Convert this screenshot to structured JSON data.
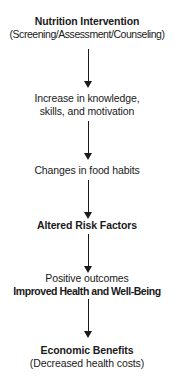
{
  "diagram": {
    "background_color": "#ffffff",
    "text_color": "#1a1a1a",
    "arrow_color": "#1a1a1a",
    "orientation": "top-to-bottom",
    "node_count": 6,
    "arrow_count": 5
  },
  "nodes": [
    {
      "id": "nutrition-intervention",
      "line1": "Nutrition Intervention",
      "line2": "(Screening/Assessment/Counseling)"
    },
    {
      "id": "increase-knowledge",
      "line1": "Increase in knowledge,",
      "line2": "skills, and motivation"
    },
    {
      "id": "changes-food-habits",
      "line1": "Changes in food habits"
    },
    {
      "id": "altered-risk-factors",
      "line1": "Altered Risk Factors"
    },
    {
      "id": "improved-health",
      "line1": "Positive outcomes",
      "line2": "Improved Health and Well-Being"
    },
    {
      "id": "economic-benefits",
      "line1": "Economic Benefits",
      "line2": "(Decreased health costs)"
    }
  ],
  "arrows": [
    {
      "id": "arrow-1",
      "from": "nutrition-intervention",
      "to": "increase-knowledge"
    },
    {
      "id": "arrow-2",
      "from": "increase-knowledge",
      "to": "changes-food-habits"
    },
    {
      "id": "arrow-3",
      "from": "changes-food-habits",
      "to": "altered-risk-factors"
    },
    {
      "id": "arrow-4",
      "from": "altered-risk-factors",
      "to": "improved-health"
    },
    {
      "id": "arrow-5",
      "from": "improved-health",
      "to": "economic-benefits"
    }
  ]
}
